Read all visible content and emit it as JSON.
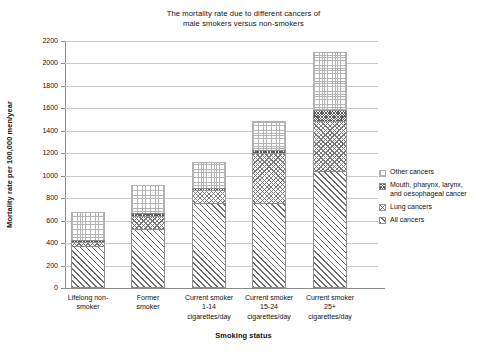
{
  "chart_data": {
    "type": "bar",
    "subtype": "stacked-bar",
    "title": "The mortality rate due to different cancers of male smokers versus non-smokers",
    "title_lines": [
      "The mortality rate due to different cancers of",
      "male smokers versus non-smokers"
    ],
    "xlabel": "Smoking status",
    "ylabel": "Mortality rate per 100,000 men/year",
    "ylim": [
      0,
      2200
    ],
    "ytick_step": 200,
    "yticks": [
      0,
      200,
      400,
      600,
      800,
      1000,
      1200,
      1400,
      1600,
      1800,
      2000,
      2200
    ],
    "grid": true,
    "grid_axis": "y",
    "legend_position": "right",
    "categories": [
      "Lifelong non-smoker",
      "Former smoker",
      "Current smoker 1-14 cigarettes/day",
      "Current smoker 15-24 cigarettes/day",
      "Current smoker 25+ cigarettes/day"
    ],
    "category_lines": [
      [
        "Lifelong non-",
        "smoker"
      ],
      [
        "Former",
        "smoker"
      ],
      [
        "Current smoker",
        "1-14",
        "cigarettes/day"
      ],
      [
        "Current smoker",
        "15-24",
        "cigarettes/day"
      ],
      [
        "Current smoker",
        "25+",
        "cigarettes/day"
      ]
    ],
    "series": [
      {
        "name": "All cancers",
        "key": "all",
        "values": [
          370,
          530,
          760,
          760,
          1040
        ]
      },
      {
        "name": "Lung cancers",
        "key": "lung",
        "values": [
          410,
          640,
          870,
          1200,
          1490
        ]
      },
      {
        "name": "Mouth, pharynx, larynx, and oesophageal cancer",
        "key": "mouth",
        "values": [
          430,
          670,
          890,
          1230,
          1590
        ]
      },
      {
        "name": "Other cancers",
        "key": "other",
        "values": [
          680,
          920,
          1120,
          1490,
          2100
        ]
      }
    ],
    "cumulative_tops": {
      "all": [
        370,
        530,
        760,
        760,
        1040
      ],
      "lung": [
        410,
        640,
        870,
        1200,
        1490
      ],
      "mouth": [
        430,
        670,
        890,
        1230,
        1590
      ],
      "other": [
        680,
        920,
        1120,
        1490,
        2100
      ]
    }
  },
  "legend": {
    "items": [
      {
        "label": "Other cancers",
        "lines": [
          "Other cancers"
        ],
        "key": "other"
      },
      {
        "label": "Mouth, pharynx, larynx, and oesophageal cancer",
        "lines": [
          "Mouth, pharynx, larynx,",
          "and oesophageal cancer"
        ],
        "key": "mouth"
      },
      {
        "label": "Lung cancers",
        "lines": [
          "Lung cancers"
        ],
        "key": "lung"
      },
      {
        "label": "All cancers",
        "lines": [
          "All cancers"
        ],
        "key": "all"
      }
    ]
  },
  "colors": {
    "background": "#ffffff",
    "axis": "#8b8b8b",
    "grid": "#c9c9c9",
    "text": "#111111"
  }
}
